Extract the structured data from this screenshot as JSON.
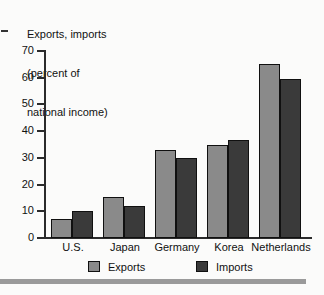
{
  "chart_data": {
    "type": "bar",
    "title": "Exports, imports (percent of national income)",
    "title_lines": [
      "Exports, imports",
      "(percent of",
      "national income)"
    ],
    "xlabel": "",
    "ylabel": "Exports, imports (percent of national income)",
    "ylim": [
      0,
      70
    ],
    "yticks": [
      0,
      10,
      20,
      30,
      40,
      50,
      60,
      70
    ],
    "ytick_labels": [
      "0",
      "10",
      "20",
      "30",
      "40",
      "50",
      "60",
      "70"
    ],
    "grid": false,
    "legend_position": "bottom",
    "categories": [
      "U.S.",
      "Japan",
      "Germany",
      "Korea",
      "Netherlands"
    ],
    "series": [
      {
        "name": "Exports",
        "color": "#8a8a8a",
        "values": [
          7,
          15.5,
          33,
          35,
          65
        ]
      },
      {
        "name": "Imports",
        "color": "#3a3a3a",
        "values": [
          10,
          11.8,
          29.8,
          36.5,
          59.5
        ]
      }
    ]
  },
  "legend": {
    "items": [
      {
        "label": "Exports"
      },
      {
        "label": "Imports"
      }
    ]
  },
  "colors": {
    "exports": "#8a8a8a",
    "imports": "#3a3a3a",
    "axis": "#2b2b2b",
    "rule": "#9a9a9a",
    "background": "#fbfbfa"
  }
}
